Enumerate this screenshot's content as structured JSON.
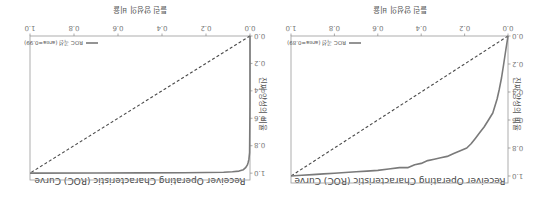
{
  "orientation": "rotated-180",
  "chart_data": [
    {
      "type": "line",
      "title": "Receiver Operating Characteristic (ROC) Curve",
      "xlabel": "틀린 양성의 비율",
      "ylabel": "진짜 양성의 비율",
      "xlim": [
        0.0,
        1.0
      ],
      "ylim": [
        0.0,
        1.05
      ],
      "xticks": [
        "0.0",
        "0.2",
        "0.4",
        "0.6",
        "0.8",
        "1.0"
      ],
      "yticks": [
        "0.0",
        "0.2",
        "0.4",
        "0.6",
        "0.8",
        "1.0"
      ],
      "legend": {
        "position": "lower-right",
        "entries": [
          "ROC 곡선 (area=0.89)"
        ]
      },
      "series": [
        {
          "name": "ROC 곡선 (area=0.89)",
          "style": "solid",
          "color": "#7a7a7a",
          "x": [
            0.0,
            0.01,
            0.02,
            0.03,
            0.04,
            0.05,
            0.07,
            0.09,
            0.11,
            0.13,
            0.15,
            0.17,
            0.19,
            0.22,
            0.25,
            0.28,
            0.31,
            0.34,
            0.37,
            0.4,
            0.43,
            0.46,
            0.5,
            0.55,
            0.6,
            0.65,
            0.7,
            0.75,
            0.8,
            0.85,
            0.9,
            0.95,
            1.0
          ],
          "y": [
            0.0,
            0.1,
            0.2,
            0.3,
            0.38,
            0.45,
            0.55,
            0.6,
            0.65,
            0.69,
            0.73,
            0.77,
            0.8,
            0.82,
            0.84,
            0.86,
            0.87,
            0.88,
            0.89,
            0.91,
            0.92,
            0.94,
            0.94,
            0.95,
            0.96,
            0.965,
            0.97,
            0.975,
            0.98,
            0.985,
            0.99,
            0.995,
            1.0
          ]
        },
        {
          "name": "random",
          "style": "dashed",
          "color": "#4a4a4a",
          "x": [
            0.0,
            1.0
          ],
          "y": [
            0.0,
            1.0
          ]
        }
      ]
    },
    {
      "type": "line",
      "title": "Receiver Operating Characteristic (ROC) Curve",
      "xlabel": "틀린 양성의 비율",
      "ylabel": "진짜 양성의 비율",
      "xlim": [
        0.0,
        1.0
      ],
      "ylim": [
        0.0,
        1.05
      ],
      "xticks": [
        "0.0",
        "0.2",
        "0.4",
        "0.6",
        "0.8",
        "1.0"
      ],
      "yticks": [
        "0.0",
        "0.2",
        "0.4",
        "0.6",
        "0.8",
        "1.0"
      ],
      "legend": {
        "position": "lower-right",
        "entries": [
          "ROC 곡선 (area=0.99)"
        ]
      },
      "series": [
        {
          "name": "ROC 곡선 (area=0.99)",
          "style": "solid",
          "color": "#7a7a7a",
          "x": [
            0.0,
            0.0,
            0.002,
            0.005,
            0.008,
            0.012,
            0.02,
            0.03,
            0.05,
            0.08,
            0.12,
            0.2,
            0.3,
            0.5,
            0.7,
            1.0
          ],
          "y": [
            0.0,
            0.5,
            0.85,
            0.9,
            0.92,
            0.94,
            0.96,
            0.975,
            0.985,
            0.99,
            0.993,
            0.995,
            0.997,
            0.998,
            0.999,
            1.0
          ]
        },
        {
          "name": "random",
          "style": "dashed",
          "color": "#4a4a4a",
          "x": [
            0.0,
            1.0
          ],
          "y": [
            0.0,
            1.0
          ]
        }
      ]
    }
  ]
}
